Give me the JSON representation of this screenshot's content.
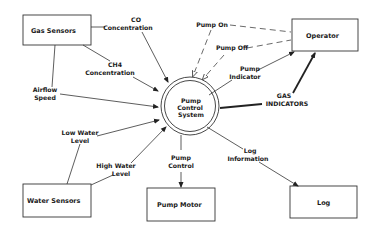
{
  "diagram": {
    "type": "context-data-flow-diagram",
    "process": {
      "label_lines": [
        "Pump",
        "Control",
        "System"
      ]
    },
    "entities": {
      "gas_sensors": "Gas Sensors",
      "operator": "Operator",
      "water_sensors": "Water Sensors",
      "pump_motor": "Pump Motor",
      "log": "Log"
    },
    "flows": {
      "co_concentration": [
        "CO",
        "Concentration"
      ],
      "ch4_concentration": [
        "CH4",
        "Concentration"
      ],
      "airflow_speed": [
        "Airflow",
        "Speed"
      ],
      "pump_on": [
        "Pump On"
      ],
      "pump_off": [
        "Pump Off"
      ],
      "pump_indicator": [
        "Pump",
        "Indicator"
      ],
      "gas_indicators": [
        "GAS",
        "INDICATORS"
      ],
      "low_water_level": [
        "Low Water",
        "Level"
      ],
      "high_water_level": [
        "High Water",
        "Level"
      ],
      "pump_control": [
        "Pump",
        "Control"
      ],
      "log_information": [
        "Log",
        "Information"
      ]
    }
  }
}
